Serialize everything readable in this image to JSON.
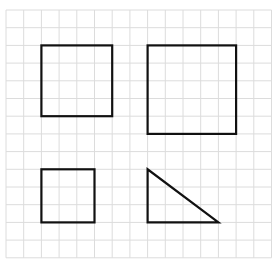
{
  "grid": {
    "origin_x": 6,
    "origin_y": 10,
    "cell": 17.7,
    "cols": 15,
    "rows": 14,
    "line_color": "#dcdcdc",
    "stroke_color": "#111111"
  },
  "shapes": [
    {
      "name": "square-small-top-left",
      "type": "square",
      "col": 2,
      "row": 2,
      "w": 4,
      "h": 4
    },
    {
      "name": "square-large-top-right",
      "type": "square",
      "col": 8,
      "row": 2,
      "w": 5,
      "h": 5
    },
    {
      "name": "square-small-bottom-left",
      "type": "square",
      "col": 2,
      "row": 9,
      "w": 3,
      "h": 3
    },
    {
      "name": "right-triangle-bottom-right",
      "type": "triangle",
      "points": [
        [
          8,
          9
        ],
        [
          8,
          12
        ],
        [
          12,
          12
        ]
      ]
    }
  ]
}
